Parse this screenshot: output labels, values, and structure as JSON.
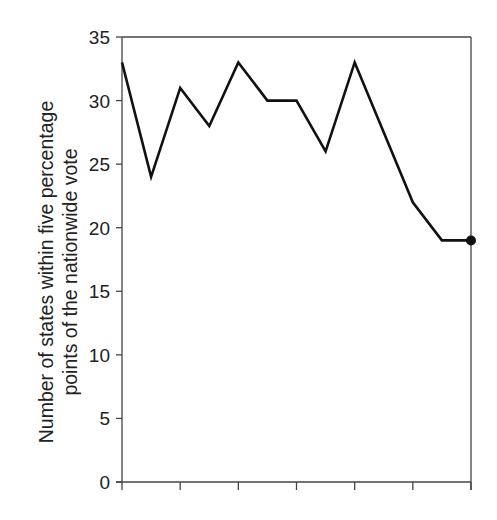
{
  "chart_data": {
    "type": "line",
    "title": "",
    "xlabel": "",
    "ylabel": "Number of states within five percentage points of the nationwide vote",
    "ylabel_lines": [
      "Number of states within five percentage",
      "points of the nationwide vote"
    ],
    "ylim": [
      0,
      35
    ],
    "yticks": [
      0,
      5,
      10,
      15,
      20,
      25,
      30,
      35
    ],
    "x_major_ticks": 7,
    "x": [
      0,
      1,
      2,
      3,
      4,
      5,
      6,
      7,
      8,
      9,
      10,
      11,
      12
    ],
    "values": [
      33,
      24,
      31,
      28,
      33,
      30,
      30,
      26,
      33,
      27.5,
      22,
      19,
      19
    ],
    "last_point_marker": true,
    "grid": false,
    "legend": null,
    "line_color": "#111111"
  }
}
